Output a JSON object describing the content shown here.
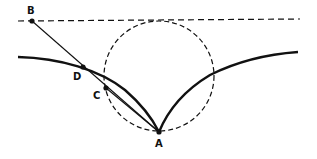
{
  "diagram": {
    "type": "geometric construction (cycloid-like curves with circle)",
    "colors": {
      "ink": "#111111",
      "background": "#ffffff"
    },
    "points": {
      "A": {
        "label": "A",
        "x": 159,
        "y": 132
      },
      "B": {
        "label": "B",
        "x": 32,
        "y": 21
      },
      "C": {
        "label": "C",
        "x": 106,
        "y": 88
      },
      "D": {
        "label": "D",
        "x": 83,
        "y": 67
      }
    },
    "elements": [
      {
        "kind": "dashed-line",
        "name": "horizontal-tangent-line",
        "from": [
          18,
          21
        ],
        "to": [
          300,
          19
        ]
      },
      {
        "kind": "dashed-circle",
        "name": "rolling-circle",
        "center": [
          159,
          76
        ],
        "radius": 55
      },
      {
        "kind": "solid-curve",
        "name": "left-cusp-curve",
        "from": [
          18,
          57
        ],
        "to": [
          159,
          132
        ]
      },
      {
        "kind": "solid-curve",
        "name": "right-cusp-curve",
        "from": [
          159,
          132
        ],
        "to": [
          298,
          52
        ]
      },
      {
        "kind": "solid-line",
        "name": "segment-BA",
        "from": "B",
        "to": "A"
      },
      {
        "kind": "solid-line",
        "name": "segment-CA",
        "from": "C",
        "to": "A"
      }
    ]
  }
}
